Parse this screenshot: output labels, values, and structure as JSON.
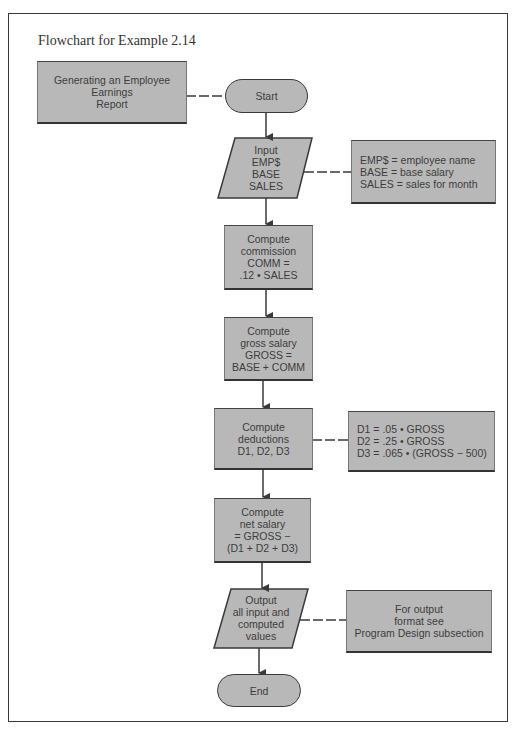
{
  "figure": {
    "caption": "Flowchart for Example 2.14"
  },
  "flowchart": {
    "title_box": "Generating an Employee\nEarnings\nReport",
    "start": "Start",
    "input": "Input\nEMP$\nBASE\nSALES",
    "input_note": "EMP$  =  employee name\nBASE  =  base salary\nSALES  =  sales for month",
    "commission": "Compute\ncommission\nCOMM  =\n.12 • SALES",
    "gross": "Compute\ngross salary\nGROSS  =\nBASE  +  COMM",
    "deductions": "Compute\ndeductions\nD1, D2, D3",
    "deductions_note": "D1  =  .05 • GROSS\nD2  =  .25 • GROSS\nD3  =  .065 • (GROSS − 500)",
    "net": "Compute\nnet salary\n=  GROSS  −\n(D1 + D2 + D3)",
    "output": "Output\nall input and\ncomputed\nvalues",
    "output_note": "For output\nformat see\nProgram Design subsection",
    "end": "End"
  },
  "colors": {
    "shape_fill": "#b8b8b8",
    "line": "#3a3a3a"
  }
}
